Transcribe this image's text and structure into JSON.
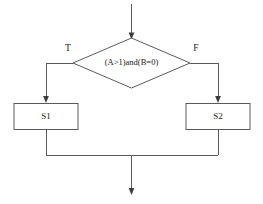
{
  "diagram": {
    "type": "flowchart",
    "entry": {
      "name": "entry-arrow",
      "label": ""
    },
    "decision": {
      "label": "(A>1)and(B=0)",
      "shape": "diamond"
    },
    "branches": [
      {
        "key": "true",
        "label": "T",
        "target": "S1"
      },
      {
        "key": "false",
        "label": "F",
        "target": "S2"
      }
    ],
    "process_nodes": [
      {
        "key": "s1",
        "label": "S1",
        "shape": "rectangle"
      },
      {
        "key": "s2",
        "label": "S2",
        "shape": "rectangle"
      }
    ],
    "exit": {
      "name": "exit-arrow",
      "label": ""
    },
    "colors": {
      "line": "#5a5a5a",
      "arrow": "#3d3d3d",
      "text": "#1a1a1a",
      "background": "#ffffff",
      "node_fill": "#ffffff"
    }
  }
}
